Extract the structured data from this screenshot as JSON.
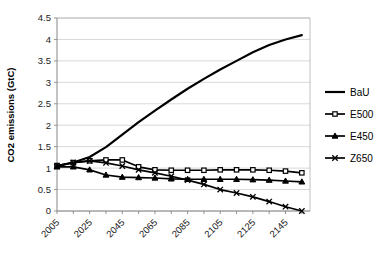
{
  "chart_data": {
    "type": "line",
    "title": "",
    "xlabel": "",
    "ylabel": "CO2 emissions (GtC)",
    "xlim": [
      2005,
      2160
    ],
    "ylim": [
      0,
      4.5
    ],
    "grid": true,
    "legend_position": "right",
    "y_ticks": [
      "0",
      "0.5",
      "1",
      "1.5",
      "2",
      "2.5",
      "3",
      "3.5",
      "4",
      "4.5"
    ],
    "y_tick_values": [
      0,
      0.5,
      1,
      1.5,
      2,
      2.5,
      3,
      3.5,
      4,
      4.5
    ],
    "x_ticks": [
      "2005",
      "2025",
      "2045",
      "2065",
      "2085",
      "2105",
      "2125",
      "2145"
    ],
    "x_tick_values": [
      2005,
      2025,
      2045,
      2065,
      2085,
      2105,
      2125,
      2145
    ],
    "x_minor_step": 10,
    "x": [
      2005,
      2015,
      2025,
      2035,
      2045,
      2055,
      2065,
      2075,
      2085,
      2095,
      2105,
      2115,
      2125,
      2135,
      2145,
      2155
    ],
    "series": [
      {
        "name": "BaU",
        "marker": "none",
        "values": [
          1.05,
          1.13,
          1.26,
          1.49,
          1.78,
          2.07,
          2.34,
          2.6,
          2.85,
          3.08,
          3.3,
          3.5,
          3.7,
          3.87,
          4.0,
          4.1
        ]
      },
      {
        "name": "E500",
        "marker": "open-square",
        "values": [
          1.06,
          1.13,
          1.17,
          1.19,
          1.19,
          1.03,
          0.96,
          0.95,
          0.95,
          0.95,
          0.96,
          0.96,
          0.96,
          0.95,
          0.93,
          0.89
        ]
      },
      {
        "name": "E450",
        "marker": "filled-triangle",
        "values": [
          1.03,
          1.03,
          0.96,
          0.84,
          0.79,
          0.78,
          0.77,
          0.75,
          0.74,
          0.74,
          0.74,
          0.74,
          0.73,
          0.72,
          0.7,
          0.68
        ]
      },
      {
        "name": "Z650",
        "marker": "x",
        "values": [
          1.04,
          1.13,
          1.17,
          1.12,
          1.05,
          0.96,
          0.89,
          0.81,
          0.72,
          0.62,
          0.5,
          0.42,
          0.33,
          0.22,
          0.1,
          0.0
        ]
      }
    ]
  },
  "legend": {
    "items": [
      {
        "label": "BaU",
        "marker": "none"
      },
      {
        "label": "E500",
        "marker": "open-square"
      },
      {
        "label": "E450",
        "marker": "filled-triangle"
      },
      {
        "label": "Z650",
        "marker": "x"
      }
    ]
  },
  "colors": {
    "series": "#000000",
    "gridline": "#c8c8c8",
    "axis": "#7a7a7a",
    "background": "#ffffff"
  }
}
